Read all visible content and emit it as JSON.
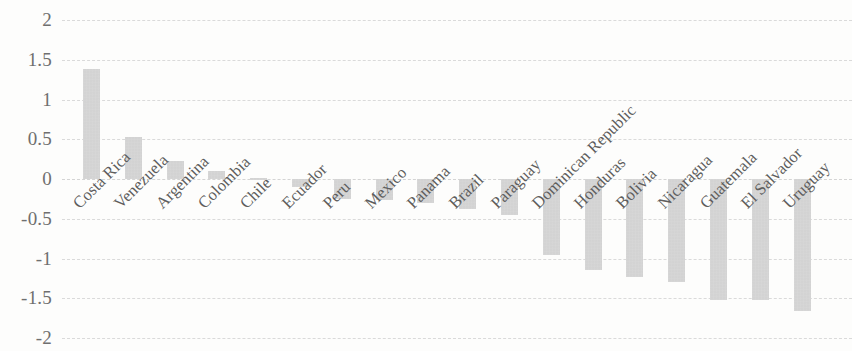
{
  "chart_data": {
    "type": "bar",
    "title": "",
    "subtitle": "",
    "xlabel": "",
    "ylabel": "",
    "ylim": [
      -2,
      2
    ],
    "y_ticks": [
      2,
      1.5,
      1,
      0.5,
      0,
      -0.5,
      -1,
      -1.5,
      -2
    ],
    "y_tick_labels": [
      "2",
      "1.5",
      "1",
      "0.5",
      "0",
      "-0.5",
      "-1",
      "-1.5",
      "-2"
    ],
    "grid": true,
    "grid_style": "dashed-horizontal",
    "legend": null,
    "legend_position": "none",
    "bar_color": "#c6c6c6",
    "background_color": "#fdfdfc",
    "axis_label_color": "#6f6f6f",
    "category_label_rotation": -45,
    "categories": [
      "Costa Rica",
      "Venezuela",
      "Argentina",
      "Colombia",
      "Chile",
      "Ecuador",
      "Peru",
      "Mexico",
      "Panama",
      "Brazil",
      "Paraguay",
      "Dominican Republic",
      "Honduras",
      "Bolivia",
      "Nicaragua",
      "Guatemala",
      "El Salvador",
      "Uruguay"
    ],
    "values": [
      1.38,
      0.53,
      0.23,
      0.1,
      0.01,
      -0.1,
      -0.25,
      -0.27,
      -0.3,
      -0.38,
      -0.45,
      -0.95,
      -1.15,
      -1.23,
      -1.3,
      -1.52,
      -1.52,
      -1.66
    ]
  }
}
